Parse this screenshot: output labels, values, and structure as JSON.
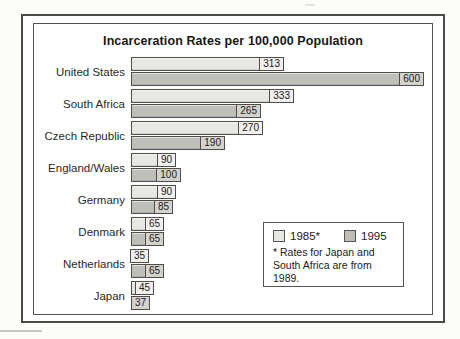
{
  "chart_data": {
    "type": "bar",
    "orientation": "horizontal",
    "title": "Incarceration Rates per 100,000 Population",
    "categories": [
      "United States",
      "South Africa",
      "Czech Republic",
      "England/Wales",
      "Germany",
      "Denmark",
      "Netherlands",
      "Japan"
    ],
    "series": [
      {
        "name": "1985*",
        "values": [
          313,
          333,
          270,
          90,
          90,
          65,
          35,
          45
        ],
        "color": "#e8e7e2",
        "label_bg": "#f0efeb"
      },
      {
        "name": "1995",
        "values": [
          600,
          265,
          190,
          100,
          85,
          65,
          65,
          37
        ],
        "color": "#bfbeb9",
        "label_bg": "#d3d2cd"
      }
    ],
    "value_labels_shown": true,
    "xlim": [
      0,
      617
    ],
    "axes_shown": false,
    "grid": false,
    "legend_position": "bottom-right"
  },
  "legend": {
    "items": [
      {
        "label": "1985*",
        "color": "#e8e7e2"
      },
      {
        "label": "1995",
        "color": "#bfbeb9"
      }
    ],
    "footnote": "* Rates for Japan and South Africa are from 1989."
  },
  "frame": {
    "background": "#ffffff",
    "outer_border_color": "#4c4a47",
    "inner_border_color": "#56544f"
  }
}
